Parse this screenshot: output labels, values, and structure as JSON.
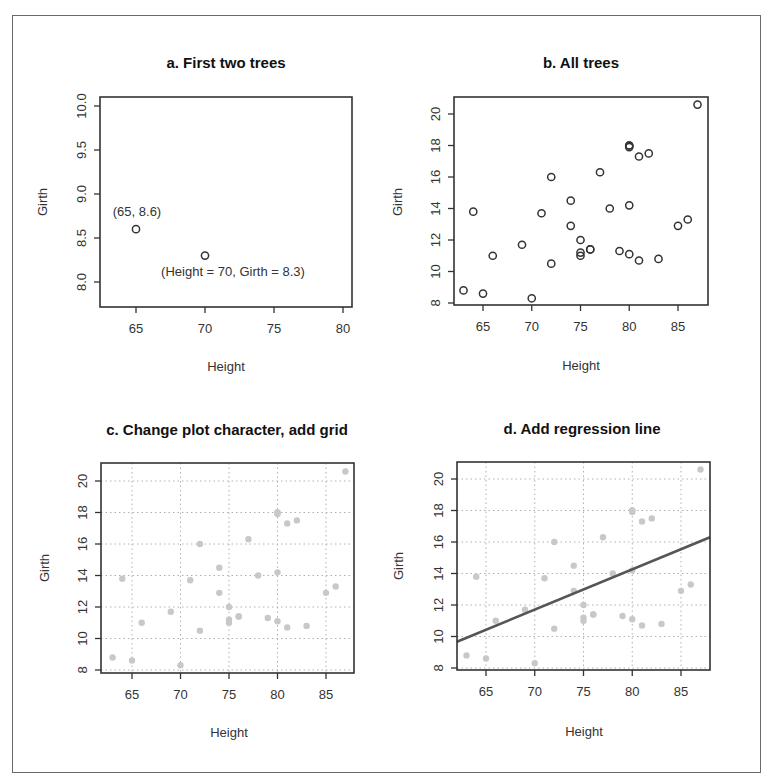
{
  "figure": {
    "panels": [
      {
        "id": "a",
        "title": "a. First two trees",
        "xlabel": "Height",
        "ylabel": "Girth"
      },
      {
        "id": "b",
        "title": "b. All trees",
        "xlabel": "Height",
        "ylabel": "Girth"
      },
      {
        "id": "c",
        "title": "c. Change plot character, add grid",
        "xlabel": "Height",
        "ylabel": "Girth"
      },
      {
        "id": "d",
        "title": "d. Add regression line",
        "xlabel": "Height",
        "ylabel": "Girth"
      }
    ],
    "annotations": {
      "a_point1": "(65, 8.6)",
      "a_point2": "(Height = 70, Girth = 8.3)"
    },
    "colors": {
      "frame": "#6a6a6a",
      "axis": "#333333",
      "open_point": "#333333",
      "filled_point": "#c8c8c8",
      "grid": "#b0b0b0",
      "regression_line": "#555555"
    }
  },
  "chart_data": [
    {
      "type": "scatter",
      "title": "a. First two trees",
      "xlabel": "Height",
      "ylabel": "Girth",
      "x": [
        65,
        70
      ],
      "y": [
        8.6,
        8.3
      ],
      "xlim": [
        62.6,
        81.5
      ],
      "ylim": [
        7.75,
        10.1
      ],
      "xticks": [
        65,
        70,
        75,
        80
      ],
      "yticks": [
        "8.0",
        "8.5",
        "9.0",
        "9.5",
        "10.0"
      ],
      "grid": false,
      "marker": "open-circle",
      "annotations": [
        {
          "x": 65,
          "y": 8.6,
          "text": "(65, 8.6)",
          "position": "above"
        },
        {
          "x": 70,
          "y": 8.3,
          "text": "(Height = 70, Girth = 8.3)",
          "position": "below"
        }
      ]
    },
    {
      "type": "scatter",
      "title": "b. All trees",
      "xlabel": "Height",
      "ylabel": "Girth",
      "x": [
        70,
        65,
        63,
        72,
        81,
        83,
        66,
        75,
        80,
        75,
        79,
        76,
        76,
        69,
        75,
        74,
        85,
        86,
        71,
        64,
        78,
        80,
        74,
        72,
        77,
        81,
        82,
        80,
        80,
        80,
        87
      ],
      "y": [
        8.3,
        8.6,
        8.8,
        10.5,
        10.7,
        10.8,
        11.0,
        11.0,
        11.1,
        11.2,
        11.3,
        11.4,
        11.4,
        11.7,
        12.0,
        12.9,
        12.9,
        13.3,
        13.7,
        13.8,
        14.0,
        14.2,
        14.5,
        16.0,
        16.3,
        17.3,
        17.5,
        17.9,
        18.0,
        18.0,
        20.6
      ],
      "xlim": [
        62,
        88
      ],
      "ylim": [
        7.8,
        21.0
      ],
      "xticks": [
        65,
        70,
        75,
        80,
        85
      ],
      "yticks": [
        8,
        10,
        12,
        14,
        16,
        18,
        20
      ],
      "grid": false,
      "marker": "open-circle"
    },
    {
      "type": "scatter",
      "title": "c. Change plot character, add grid",
      "xlabel": "Height",
      "ylabel": "Girth",
      "x": [
        70,
        65,
        63,
        72,
        81,
        83,
        66,
        75,
        80,
        75,
        79,
        76,
        76,
        69,
        75,
        74,
        85,
        86,
        71,
        64,
        78,
        80,
        74,
        72,
        77,
        81,
        82,
        80,
        80,
        80,
        87
      ],
      "y": [
        8.3,
        8.6,
        8.8,
        10.5,
        10.7,
        10.8,
        11.0,
        11.0,
        11.1,
        11.2,
        11.3,
        11.4,
        11.4,
        11.7,
        12.0,
        12.9,
        12.9,
        13.3,
        13.7,
        13.8,
        14.0,
        14.2,
        14.5,
        16.0,
        16.3,
        17.3,
        17.5,
        17.9,
        18.0,
        18.0,
        20.6
      ],
      "xlim": [
        62,
        88
      ],
      "ylim": [
        7.8,
        21.0
      ],
      "xticks": [
        65,
        70,
        75,
        80,
        85
      ],
      "yticks": [
        8,
        10,
        12,
        14,
        16,
        18,
        20
      ],
      "grid": true,
      "marker": "filled-circle-light-gray"
    },
    {
      "type": "scatter",
      "title": "d. Add regression line",
      "xlabel": "Height",
      "ylabel": "Girth",
      "x": [
        70,
        65,
        63,
        72,
        81,
        83,
        66,
        75,
        80,
        75,
        79,
        76,
        76,
        69,
        75,
        74,
        85,
        86,
        71,
        64,
        78,
        80,
        74,
        72,
        77,
        81,
        82,
        80,
        80,
        80,
        87
      ],
      "y": [
        8.3,
        8.6,
        8.8,
        10.5,
        10.7,
        10.8,
        11.0,
        11.0,
        11.1,
        11.2,
        11.3,
        11.4,
        11.4,
        11.7,
        12.0,
        12.9,
        12.9,
        13.3,
        13.7,
        13.8,
        14.0,
        14.2,
        14.5,
        16.0,
        16.3,
        17.3,
        17.5,
        17.9,
        18.0,
        18.0,
        20.6
      ],
      "xlim": [
        62,
        88
      ],
      "ylim": [
        7.8,
        21.0
      ],
      "xticks": [
        65,
        70,
        75,
        80,
        85
      ],
      "yticks": [
        8,
        10,
        12,
        14,
        16,
        18,
        20
      ],
      "grid": true,
      "marker": "filled-circle-light-gray",
      "regression_line": {
        "intercept": -6.19,
        "slope": 0.2557,
        "x_range": [
          62,
          88
        ]
      }
    }
  ]
}
